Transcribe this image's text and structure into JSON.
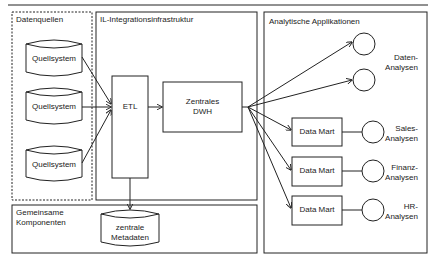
{
  "diagram": {
    "groups": {
      "sources": "Datenquellen",
      "integration": "IL-Integrationsinfrastruktur",
      "shared": [
        "Gemeinsame",
        "Komponenten"
      ],
      "analytics": "Analytische Applikationen"
    },
    "sources": [
      {
        "label": "Quellsystem"
      },
      {
        "label": "Quellsystem"
      },
      {
        "label": "Quellsystem"
      }
    ],
    "etl": "ETL",
    "dwh": [
      "Zentrales",
      "DWH"
    ],
    "metadata": [
      "zentrale",
      "Metadaten"
    ],
    "data_marts": [
      {
        "label": "Data Mart",
        "analysis": [
          "Sales-",
          "Analysen"
        ]
      },
      {
        "label": "Data Mart",
        "analysis": [
          "Finanz-",
          "Analysen"
        ]
      },
      {
        "label": "Data Mart",
        "analysis": [
          "HR-",
          "Analysen"
        ]
      }
    ],
    "direct_analysis": [
      "Daten-",
      "Analysen"
    ],
    "colors": {
      "stroke": "#222222",
      "background": "#ffffff"
    }
  }
}
